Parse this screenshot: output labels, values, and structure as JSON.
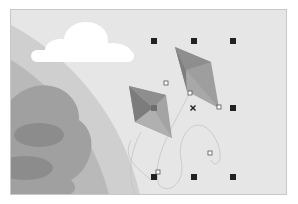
{
  "canvas": {
    "background": "#e6e6e6",
    "border": "#c8c8c8"
  },
  "artwork": {
    "cloud_color": "#ffffff",
    "planet_outer": "#bdbdbd",
    "planet_mid": "#a6a6a6",
    "planet_inner_spot": "#8a8a8a",
    "kites": [
      {
        "name": "kite-upper",
        "light": "#9a9a9a",
        "dark": "#7a7a7a"
      },
      {
        "name": "kite-lower",
        "light": "#9a9a9a",
        "dark": "#7a7a7a"
      }
    ]
  },
  "selection": {
    "handle_color": "#222222",
    "anchor_color": "#ffffff",
    "center_mark": "×"
  }
}
